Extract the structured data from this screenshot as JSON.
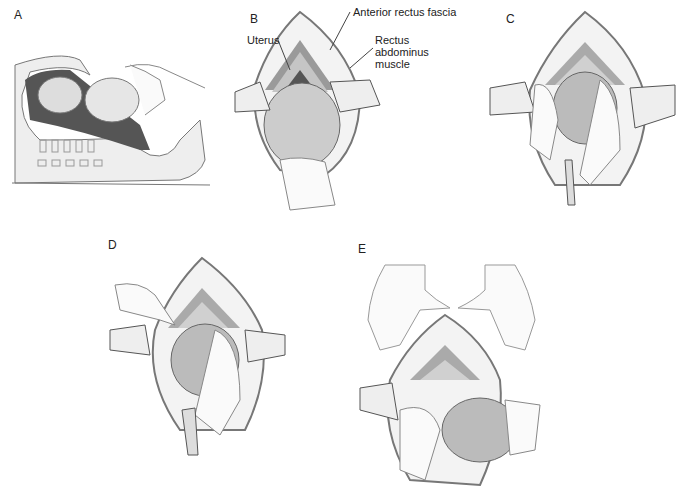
{
  "figure": {
    "panels": [
      {
        "id": "A",
        "label": "A",
        "description": "Sagittal view: fetal head elevated by hand through incision"
      },
      {
        "id": "B",
        "label": "B",
        "description": "Hand cupped under fetal head at uterine incision, retractors placed",
        "annotations": {
          "anterior_rectus_fascia": "Anterior rectus fascia",
          "uterus": "Uterus",
          "rectus_line1": "Rectus",
          "rectus_line2": "abdominus",
          "rectus_line3": "muscle"
        }
      },
      {
        "id": "C",
        "label": "C",
        "description": "Head delivered through incision with both hands"
      },
      {
        "id": "D",
        "label": "D",
        "description": "Bulb suction of nares/mouth after head delivery"
      },
      {
        "id": "E",
        "label": "E",
        "description": "Hands positioned to deliver shoulders and body"
      }
    ]
  },
  "colors": {
    "line": "#555555",
    "fascia": "#9a9a9a",
    "muscle": "#b8b8b8",
    "cavity": "#6a6a6a",
    "skin": "#f2f2f2",
    "head": "#c8c8c8"
  }
}
